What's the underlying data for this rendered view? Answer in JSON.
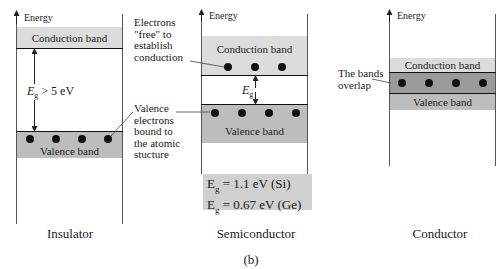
{
  "figure_label": "(b)",
  "panels": {
    "insulator": {
      "axis_label": "Energy",
      "conduction_band": "Conduction band",
      "valence_band": "Valence band",
      "gap_label": "E",
      "gap_sub": "g",
      "gap_value": " > 5 eV",
      "caption": "Insulator",
      "annotation": [
        "Valence",
        "electrons",
        "bound to",
        "the atomic",
        "stucture"
      ]
    },
    "semiconductor": {
      "axis_label": "Energy",
      "conduction_band": "Conduction band",
      "valence_band": "Valence band",
      "gap_label": "E",
      "gap_sub": "g",
      "caption": "Semiconductor",
      "annotation": [
        "Electrons",
        "\"free\" to",
        "establish",
        "conduction"
      ],
      "values_box": {
        "line1_label": "E",
        "line1_sub": "g",
        "line1_value": " = 1.1 eV (Si)",
        "line2_label": "E",
        "line2_sub": "g",
        "line2_value": " = 0.67 eV (Ge)"
      }
    },
    "conductor": {
      "axis_label": "Energy",
      "conduction_band": "Conduction band",
      "valence_band": "Valence band",
      "caption": "Conductor",
      "annotation": [
        "The bands",
        "overlap"
      ]
    }
  },
  "colors": {
    "conduction": "#dcdcdc",
    "valence": "#bdbdbd",
    "overlap": "#9a9a9a"
  }
}
